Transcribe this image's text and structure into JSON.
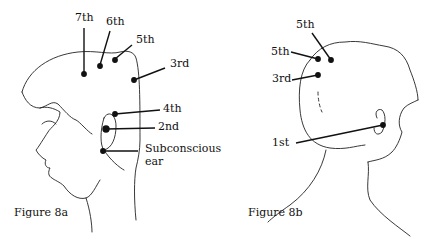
{
  "figure_a": {
    "caption": "Figure 8a",
    "labels": {
      "seventh": "7th",
      "sixth": "6th",
      "fifth": "5th",
      "third": "3rd",
      "fourth": "4th",
      "second": "2nd",
      "subconscious_line1": "Subconscious",
      "subconscious_line2": "ear"
    }
  },
  "figure_b": {
    "caption": "Figure 8b",
    "labels": {
      "fifth_top": "5th",
      "fifth_left": "5th",
      "third": "3rd",
      "first": "1st"
    }
  },
  "colors": {
    "ink": "#111111",
    "background": "#ffffff"
  }
}
